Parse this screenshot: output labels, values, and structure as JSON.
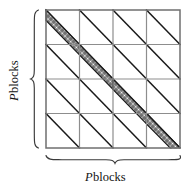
{
  "figure": {
    "kind": "block-matrix-sparsity-diagram",
    "grid": {
      "blocks_per_side": 4,
      "x0": 46,
      "y0": 10,
      "x1": 180,
      "y1": 148
    },
    "colors": {
      "background": "#ffffff",
      "outer_border": "#6f6f6f",
      "inner_gridline": "#8d8d8d",
      "block_diagonal": "#1a1a1a",
      "hatch_line": "#2b2b2b",
      "hatch_fill": "#ffffff",
      "brace": "#3a3a3a",
      "text": "#111111"
    },
    "block_diagonal_direction": "top-left-to-bottom-right",
    "hatched_blocks": [
      {
        "row": 0,
        "col": 0
      },
      {
        "row": 1,
        "col": 1
      },
      {
        "row": 2,
        "col": 2
      },
      {
        "row": 3,
        "col": 3
      }
    ],
    "hatch_band": {
      "style": "cross-hatch",
      "relative_width": 0.33,
      "position": "below-left-of-block-diagonal"
    }
  },
  "labels": {
    "left": {
      "symbol": "P",
      "word": "blocks",
      "orientation": "vertical-rotated-90-ccw"
    },
    "bottom": {
      "symbol": "P",
      "word": "blocks",
      "orientation": "horizontal"
    }
  },
  "braces": {
    "left": {
      "name": "left-brace",
      "orientation": "vertical",
      "spans": "full grid height"
    },
    "bottom": {
      "name": "bottom-brace",
      "orientation": "horizontal",
      "spans": "full grid width"
    }
  }
}
